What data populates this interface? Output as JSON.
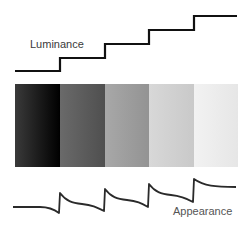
{
  "labels": {
    "luminance": "Luminance",
    "appearance": "Appearance"
  },
  "bars": [
    {
      "name": "step-1",
      "color": "#1a1a1a"
    },
    {
      "name": "step-2",
      "color": "#5a5a5a"
    },
    {
      "name": "step-3",
      "color": "#9a9a9a"
    },
    {
      "name": "step-4",
      "color": "#cfcfcf"
    },
    {
      "name": "step-5",
      "color": "#ececec"
    }
  ],
  "colors": {
    "line": "#111111",
    "curve": "#2a2a2a"
  }
}
